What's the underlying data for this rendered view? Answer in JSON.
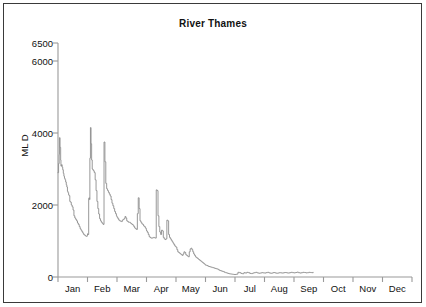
{
  "chart_data": {
    "type": "line",
    "title": "River Thames",
    "xlabel": "",
    "ylabel": "ML D",
    "ylim": [
      0,
      6500
    ],
    "yticks": [
      0,
      2000,
      4000,
      6000,
      6500
    ],
    "ytick_labels": [
      "0",
      "2000",
      "4000",
      "6000",
      "6500"
    ],
    "grid": false,
    "legend": false,
    "xtick_labels": [
      "Jan",
      "Feb",
      "Mar",
      "Apr",
      "May",
      "Jun",
      "Jul",
      "Aug",
      "Sep",
      "Oct",
      "Nov",
      "Dec"
    ],
    "xlim_months": [
      0,
      12
    ],
    "series_color": "#8c8c8c",
    "series": [
      {
        "name": "River Thames flow",
        "x_unit": "month_fraction",
        "x": [
          0.0,
          0.02,
          0.04,
          0.05,
          0.07,
          0.09,
          0.1,
          0.12,
          0.14,
          0.16,
          0.18,
          0.2,
          0.22,
          0.24,
          0.26,
          0.28,
          0.3,
          0.32,
          0.34,
          0.36,
          0.38,
          0.4,
          0.42,
          0.45,
          0.48,
          0.51,
          0.54,
          0.57,
          0.6,
          0.63,
          0.66,
          0.69,
          0.72,
          0.75,
          0.78,
          0.81,
          0.84,
          0.87,
          0.9,
          0.93,
          0.96,
          0.99,
          1.0,
          1.02,
          1.04,
          1.05,
          1.07,
          1.08,
          1.1,
          1.12,
          1.14,
          1.16,
          1.18,
          1.2,
          1.23,
          1.26,
          1.29,
          1.32,
          1.35,
          1.38,
          1.41,
          1.44,
          1.47,
          1.5,
          1.53,
          1.56,
          1.59,
          1.62,
          1.65,
          1.68,
          1.71,
          1.74,
          1.77,
          1.8,
          1.83,
          1.86,
          1.89,
          1.92,
          1.95,
          1.98,
          2.0,
          2.03,
          2.06,
          2.09,
          2.12,
          2.15,
          2.18,
          2.21,
          2.24,
          2.27,
          2.3,
          2.33,
          2.36,
          2.39,
          2.42,
          2.45,
          2.48,
          2.51,
          2.54,
          2.57,
          2.6,
          2.63,
          2.66,
          2.69,
          2.72,
          2.75,
          2.78,
          2.81,
          2.84,
          2.87,
          2.9,
          2.93,
          2.96,
          2.99,
          3.0,
          3.03,
          3.06,
          3.09,
          3.12,
          3.15,
          3.18,
          3.21,
          3.24,
          3.27,
          3.3,
          3.33,
          3.36,
          3.39,
          3.42,
          3.45,
          3.48,
          3.51,
          3.54,
          3.57,
          3.6,
          3.63,
          3.66,
          3.69,
          3.72,
          3.75,
          3.78,
          3.81,
          3.84,
          3.87,
          3.9,
          3.93,
          3.96,
          3.99,
          4.0,
          4.03,
          4.06,
          4.09,
          4.12,
          4.15,
          4.18,
          4.21,
          4.24,
          4.27,
          4.3,
          4.33,
          4.36,
          4.39,
          4.42,
          4.45,
          4.48,
          4.51,
          4.54,
          4.57,
          4.6,
          4.63,
          4.66,
          4.69,
          4.72,
          4.75,
          4.78,
          4.81,
          4.84,
          4.87,
          4.9,
          4.93,
          4.96,
          4.99,
          5.0,
          5.04,
          5.08,
          5.12,
          5.16,
          5.2,
          5.24,
          5.28,
          5.32,
          5.36,
          5.4,
          5.44,
          5.48,
          5.52,
          5.56,
          5.6,
          5.64,
          5.68,
          5.72,
          5.76,
          5.8,
          5.84,
          5.88,
          5.92,
          5.96,
          6.0,
          6.05,
          6.1,
          6.15,
          6.2,
          6.25,
          6.3,
          6.35,
          6.4,
          6.45,
          6.5,
          6.55,
          6.6,
          6.65,
          6.7,
          6.75,
          6.8,
          6.85,
          6.9,
          6.95,
          7.0,
          7.05,
          7.1,
          7.15,
          7.2,
          7.25,
          7.3,
          7.35,
          7.4,
          7.45,
          7.5,
          7.55,
          7.6,
          7.65,
          7.7,
          7.75,
          7.8,
          7.85,
          7.9,
          7.95,
          8.0,
          8.05,
          8.1,
          8.15,
          8.2,
          8.25,
          8.3,
          8.35,
          8.4,
          8.45,
          8.5,
          8.55,
          8.6,
          8.65
        ],
        "y": [
          2900,
          3150,
          3400,
          3870,
          3600,
          3250,
          3080,
          3120,
          3050,
          2980,
          2880,
          2800,
          2740,
          2700,
          2640,
          2560,
          2500,
          2380,
          2340,
          2280,
          2260,
          2100,
          2080,
          2000,
          1950,
          1860,
          1700,
          1640,
          1600,
          1560,
          1500,
          1460,
          1400,
          1340,
          1300,
          1260,
          1220,
          1180,
          1160,
          1140,
          1130,
          1150,
          1200,
          1180,
          2180,
          2200,
          2150,
          3300,
          4150,
          3700,
          3250,
          3000,
          2980,
          2950,
          2900,
          2700,
          2400,
          2100,
          1900,
          1750,
          1620,
          1560,
          1520,
          1490,
          1460,
          3750,
          3200,
          2600,
          2450,
          2400,
          2350,
          2300,
          2250,
          2150,
          2050,
          1980,
          1900,
          1820,
          1760,
          1700,
          1660,
          1620,
          1580,
          1560,
          1550,
          1540,
          1580,
          1600,
          1620,
          1680,
          1640,
          1560,
          1540,
          1520,
          1520,
          1500,
          1480,
          1460,
          1440,
          1400,
          1360,
          1340,
          1320,
          1760,
          2200,
          1900,
          1560,
          1520,
          1480,
          1460,
          1420,
          1400,
          1360,
          1320,
          1280,
          1240,
          1180,
          1120,
          1100,
          1080,
          1080,
          1090,
          1100,
          1090,
          1080,
          2420,
          2400,
          1700,
          1400,
          1250,
          1180,
          1300,
          1280,
          1100,
          1060,
          1040,
          1060,
          1580,
          1560,
          1180,
          1100,
          1060,
          1020,
          980,
          940,
          900,
          860,
          840,
          830,
          760,
          700,
          680,
          660,
          640,
          620,
          600,
          640,
          700,
          680,
          620,
          600,
          580,
          560,
          700,
          780,
          800,
          760,
          700,
          640,
          600,
          560,
          540,
          520,
          500,
          480,
          460,
          440,
          420,
          400,
          380,
          360,
          340,
          330,
          320,
          300,
          290,
          280,
          270,
          260,
          250,
          240,
          230,
          220,
          200,
          180,
          170,
          160,
          150,
          130,
          120,
          110,
          100,
          90,
          85,
          80,
          75,
          70,
          70,
          80,
          130,
          120,
          100,
          90,
          120,
          110,
          130,
          120,
          100,
          95,
          110,
          120,
          130,
          115,
          105,
          110,
          120,
          115,
          110,
          120,
          130,
          115,
          105,
          110,
          125,
          115,
          105,
          110,
          120,
          115,
          110,
          120,
          125,
          115,
          110,
          120,
          130,
          120,
          115,
          125,
          135,
          120,
          110,
          120,
          130,
          125,
          115,
          120,
          130,
          125,
          120,
          130
        ]
      }
    ]
  },
  "axis": {
    "y_axis_title": "ML D",
    "title": "River Thames"
  }
}
